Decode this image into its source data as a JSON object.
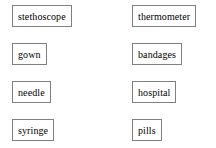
{
  "worksheet": {
    "columns": [
      {
        "name": "left-column",
        "items": [
          {
            "label": "stethoscope"
          },
          {
            "label": "gown"
          },
          {
            "label": "needle"
          },
          {
            "label": "syringe"
          }
        ]
      },
      {
        "name": "right-column",
        "items": [
          {
            "label": "thermometer"
          },
          {
            "label": "bandages"
          },
          {
            "label": "hospital"
          },
          {
            "label": "pills"
          }
        ]
      }
    ]
  },
  "colors": {
    "background": "#ffffff",
    "box_border": "#808080",
    "text": "#000000"
  }
}
